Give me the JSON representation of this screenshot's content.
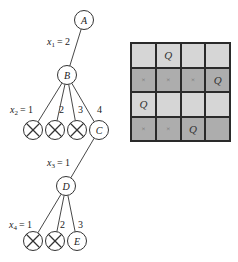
{
  "tree": {
    "nodes": [
      {
        "id": "A",
        "label": "A",
        "cx": 84,
        "cy": 20,
        "type": "node"
      },
      {
        "id": "B",
        "label": "B",
        "cx": 67,
        "cy": 75,
        "type": "node"
      },
      {
        "id": "B1",
        "label": "",
        "cx": 33,
        "cy": 130,
        "type": "pruned"
      },
      {
        "id": "B2",
        "label": "",
        "cx": 55,
        "cy": 130,
        "type": "pruned"
      },
      {
        "id": "B3",
        "label": "",
        "cx": 77,
        "cy": 130,
        "type": "pruned"
      },
      {
        "id": "C",
        "label": "C",
        "cx": 99,
        "cy": 130,
        "type": "node"
      },
      {
        "id": "D",
        "label": "D",
        "cx": 66,
        "cy": 186,
        "type": "node"
      },
      {
        "id": "D1",
        "label": "",
        "cx": 33,
        "cy": 241,
        "type": "pruned"
      },
      {
        "id": "D2",
        "label": "",
        "cx": 55,
        "cy": 241,
        "type": "pruned"
      },
      {
        "id": "E",
        "label": "E",
        "cx": 77,
        "cy": 241,
        "type": "node"
      }
    ],
    "edges": [
      {
        "from": "A",
        "to": "B"
      },
      {
        "from": "B",
        "to": "B1"
      },
      {
        "from": "B",
        "to": "B2"
      },
      {
        "from": "B",
        "to": "B3"
      },
      {
        "from": "B",
        "to": "C"
      },
      {
        "from": "C",
        "to": "D"
      },
      {
        "from": "D",
        "to": "D1"
      },
      {
        "from": "D",
        "to": "D2"
      },
      {
        "from": "D",
        "to": "E"
      }
    ],
    "edge_labels": {
      "x1": {
        "var": "x",
        "sub": "1",
        "value": "= 2"
      },
      "x2": {
        "var": "x",
        "sub": "2",
        "value": "= 1"
      },
      "b2": "2",
      "b3": "3",
      "b4": "4",
      "x3": {
        "var": "x",
        "sub": "3",
        "value": "= 1"
      },
      "x4": {
        "var": "x",
        "sub": "4",
        "value": "= 1"
      },
      "d2": "2",
      "d3": "3"
    }
  },
  "board": {
    "size": 4,
    "rows": [
      {
        "shade": "light",
        "cells": [
          "",
          "Q",
          "",
          ""
        ]
      },
      {
        "shade": "dark",
        "cells": [
          "×",
          "×",
          "×",
          "Q"
        ]
      },
      {
        "shade": "light",
        "cells": [
          "Q",
          "",
          "",
          ""
        ]
      },
      {
        "shade": "dark",
        "cells": [
          "×",
          "×",
          "Q",
          ""
        ]
      }
    ]
  },
  "colors": {
    "light_cell": "#d6d6d6",
    "dark_cell": "#adadad",
    "line": "#2a2a2a"
  }
}
